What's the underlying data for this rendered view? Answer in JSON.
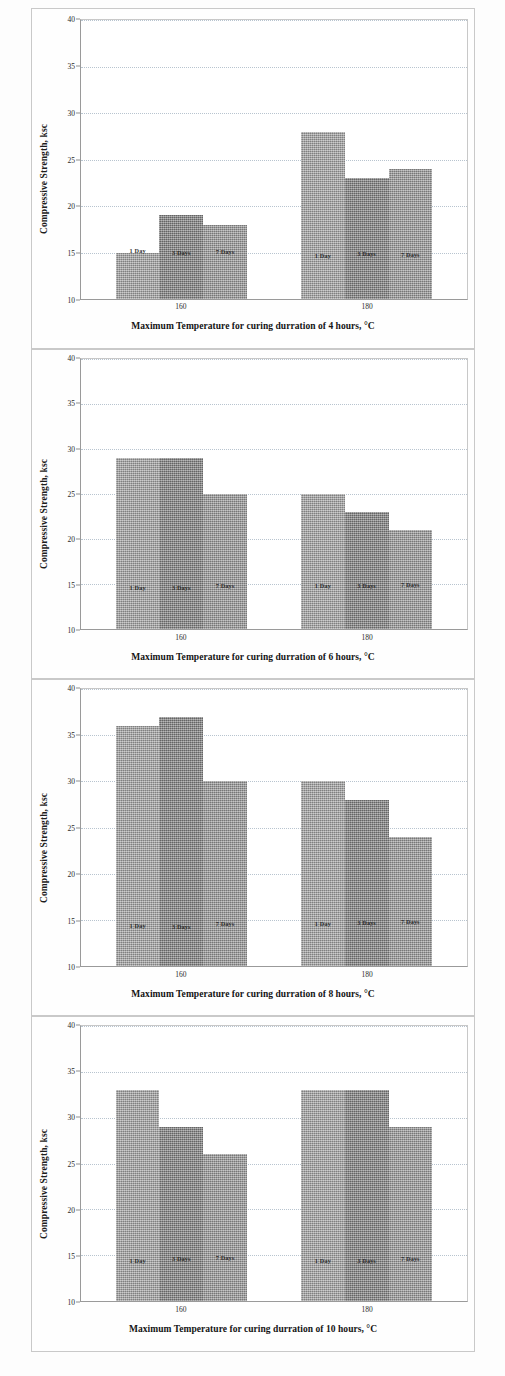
{
  "document": {
    "kind": "scanned-figure-sheet",
    "panel_count": 4
  },
  "axis": {
    "y_title": "Compressive Strength, ksc",
    "y_ticks": [
      "10",
      "15",
      "20",
      "25",
      "30",
      "35",
      "40"
    ],
    "x_ticks": [
      "160",
      "180"
    ]
  },
  "series_labels": [
    "1 Day",
    "3 Days",
    "7 Days"
  ],
  "panels": [
    {
      "id": "panel-4-hours",
      "xtitle": "Maximum Temperature for curing durration of 4 hours, °C"
    },
    {
      "id": "panel-6-hours",
      "xtitle": "Maximum Temperature for curing durration of 6 hours, °C"
    },
    {
      "id": "panel-8-hours",
      "xtitle": "Maximum Temperature for curing durration of 8 hours, °C"
    },
    {
      "id": "panel-10-hours",
      "xtitle": "Maximum Temperature for curing durration of 10 hours, °C"
    }
  ],
  "colors": {
    "bar_1_day": "#9c9c9c",
    "bar_3_days": "#848484",
    "bar_7_days": "#959595",
    "grid": "#b8c4cf",
    "axis": "#9a9a9a",
    "text": "#1a1a1a",
    "panel_border": "#c9c9c9",
    "page_background": "#fdfdfd"
  },
  "chart_data": [
    {
      "type": "bar",
      "title": "",
      "xlabel": "Maximum Temperature for curing durration of 4 hours, °C",
      "ylabel": "Compressive Strength, ksc",
      "ylim": [
        10,
        40
      ],
      "ytick_step": 5,
      "grid": true,
      "legend_position": "in-bar-labels",
      "categories": [
        "160",
        "180"
      ],
      "series": [
        {
          "name": "1 Day",
          "values": [
            15,
            28
          ]
        },
        {
          "name": "3 Days",
          "values": [
            19,
            23
          ]
        },
        {
          "name": "7 Days",
          "values": [
            18,
            24
          ]
        }
      ]
    },
    {
      "type": "bar",
      "title": "",
      "xlabel": "Maximum Temperature for curing durration of 6 hours, °C",
      "ylabel": "Compressive Strength, ksc",
      "ylim": [
        10,
        40
      ],
      "ytick_step": 5,
      "grid": true,
      "legend_position": "in-bar-labels",
      "categories": [
        "160",
        "180"
      ],
      "series": [
        {
          "name": "1 Day",
          "values": [
            29,
            25
          ]
        },
        {
          "name": "3 Days",
          "values": [
            29,
            23
          ]
        },
        {
          "name": "7 Days",
          "values": [
            25,
            21
          ]
        }
      ]
    },
    {
      "type": "bar",
      "title": "",
      "xlabel": "Maximum Temperature for curing durration of 8 hours, °C",
      "ylabel": "Compressive Strength, ksc",
      "ylim": [
        10,
        40
      ],
      "ytick_step": 5,
      "grid": true,
      "legend_position": "in-bar-labels",
      "categories": [
        "160",
        "180"
      ],
      "series": [
        {
          "name": "1 Day",
          "values": [
            36,
            30
          ]
        },
        {
          "name": "3 Days",
          "values": [
            37,
            28
          ]
        },
        {
          "name": "7 Days",
          "values": [
            30,
            24
          ]
        }
      ]
    },
    {
      "type": "bar",
      "title": "",
      "xlabel": "Maximum Temperature for curing durration of 10 hours, °C",
      "ylabel": "Compressive Strength, ksc",
      "ylim": [
        10,
        40
      ],
      "ytick_step": 5,
      "grid": true,
      "legend_position": "in-bar-labels",
      "categories": [
        "160",
        "180"
      ],
      "series": [
        {
          "name": "1 Day",
          "values": [
            33,
            33
          ]
        },
        {
          "name": "3 Days",
          "values": [
            29,
            33
          ]
        },
        {
          "name": "7 Days",
          "values": [
            26,
            29
          ]
        }
      ]
    }
  ]
}
